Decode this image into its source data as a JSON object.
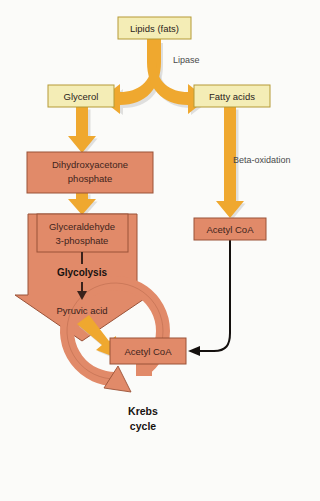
{
  "diagram": {
    "background_color": "#fbfbf9",
    "palette": {
      "yellow_box_fill": "#f4edb6",
      "yellow_box_stroke": "#b59a37",
      "salmon_fill": "#e18a69",
      "salmon_stroke": "#9a5238",
      "orange_arrow": "#efa82f",
      "connector_black": "#14100e"
    },
    "nodes": {
      "lipids": {
        "label": "Lipids (fats)",
        "type": "yellow-box"
      },
      "glycerol": {
        "label": "Glycerol",
        "type": "yellow-box"
      },
      "fatty_acids": {
        "label": "Fatty acids",
        "type": "yellow-box"
      },
      "dhap": {
        "label_line1": "Dihydroxyacetone",
        "label_line2": "phosphate",
        "type": "salmon-box"
      },
      "g3p": {
        "label_line1": "Glyceraldehyde",
        "label_line2": "3-phosphate",
        "type": "salmon-arrow"
      },
      "glycolysis": {
        "label": "Glycolysis",
        "type": "inner-step-bold"
      },
      "pyruvic_acid": {
        "label": "Pyruvic acid",
        "type": "inner-step"
      },
      "acetyl_coa_right": {
        "label": "Acetyl CoA",
        "type": "salmon-box"
      },
      "acetyl_coa_bottom": {
        "label": "Acetyl CoA",
        "type": "salmon-box"
      },
      "krebs_cycle": {
        "label_line1": "Krebs",
        "label_line2": "cycle",
        "type": "salmon-ring-arrow"
      }
    },
    "edge_labels": {
      "lipase": "Lipase",
      "beta_oxidation": "Beta-oxidation"
    },
    "flow_order": [
      "Lipids (fats)",
      "Glycerol",
      "Fatty acids",
      "Dihydroxyacetone phosphate",
      "Glyceraldehyde 3-phosphate",
      "Glycolysis",
      "Pyruvic acid",
      "Acetyl CoA",
      "Krebs cycle"
    ]
  }
}
